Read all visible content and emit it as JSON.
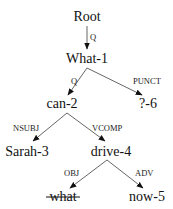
{
  "diagram": {
    "type": "dependency-tree",
    "nodes": [
      {
        "id": "root",
        "label": "Root",
        "x": 87,
        "y": 21
      },
      {
        "id": "what1",
        "label": "What-1",
        "x": 87,
        "y": 63
      },
      {
        "id": "can2",
        "label": "can-2",
        "x": 62,
        "y": 108
      },
      {
        "id": "q6",
        "label": "?-6",
        "x": 148,
        "y": 108
      },
      {
        "id": "sarah3",
        "label": "Sarah-3",
        "x": 27,
        "y": 156
      },
      {
        "id": "drive4",
        "label": "drive-4",
        "x": 111,
        "y": 156
      },
      {
        "id": "what",
        "label": "what",
        "x": 63,
        "y": 201,
        "strikethrough": true
      },
      {
        "id": "now5",
        "label": "now-5",
        "x": 147,
        "y": 201
      }
    ],
    "edges": [
      {
        "from": "root",
        "to": "what1",
        "label": "Q"
      },
      {
        "from": "what1",
        "to": "can2",
        "label": "Q"
      },
      {
        "from": "what1",
        "to": "q6",
        "label": "PUNCT"
      },
      {
        "from": "can2",
        "to": "sarah3",
        "label": "NSUBJ"
      },
      {
        "from": "can2",
        "to": "drive4",
        "label": "VCOMP"
      },
      {
        "from": "drive4",
        "to": "what",
        "label": "OBJ"
      },
      {
        "from": "drive4",
        "to": "now5",
        "label": "ADV"
      }
    ]
  }
}
